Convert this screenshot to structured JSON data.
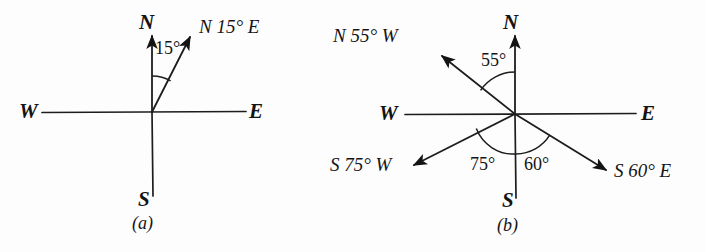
{
  "figure": {
    "background_color": "#fdfdfd",
    "ink_color": "#141414",
    "panels": [
      {
        "id": "a",
        "caption": "(a)",
        "origin": {
          "x": 152,
          "y": 112
        },
        "cardinals": {
          "north": "N",
          "south": "S",
          "east": "E",
          "west": "W"
        },
        "rays": [
          {
            "name": "n15e",
            "label": "N 15° E",
            "angle_label": "15°",
            "bearing_from_north_deg": 15,
            "direction": "east_of_north"
          }
        ]
      },
      {
        "id": "b",
        "caption": "(b)",
        "origin": {
          "x": 515,
          "y": 114
        },
        "cardinals": {
          "north": "N",
          "south": "S",
          "east": "E",
          "west": "W"
        },
        "rays": [
          {
            "name": "n55w",
            "label": "N 55° W",
            "angle_label": "55°",
            "bearing_from_north_deg": 55,
            "direction": "west_of_north"
          },
          {
            "name": "s60e",
            "label": "S 60° E",
            "angle_label": "60°",
            "bearing_from_south_deg": 60,
            "direction": "east_of_south"
          },
          {
            "name": "s75w",
            "label": "S 75° W",
            "angle_label": "75°",
            "bearing_from_south_deg": 75,
            "direction": "west_of_south"
          }
        ]
      }
    ]
  }
}
